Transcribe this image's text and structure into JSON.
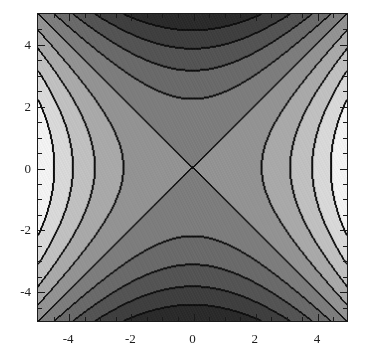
{
  "figure": {
    "background_color": "#ffffff",
    "frame_color": "#1a1a1a",
    "contour_line_color": "#101010"
  },
  "chart_data": {
    "type": "heatmap",
    "plot_style": "filled-contour",
    "title": "",
    "subtitle": "",
    "xlabel": "",
    "ylabel": "",
    "xlim": [
      -5,
      5
    ],
    "ylim": [
      -5,
      5
    ],
    "grid": false,
    "legend": "none",
    "colormap": "grayscale",
    "function_form": "saddle (x^2 - y^2 type): light at left/right edges, dark at top/bottom edges",
    "x_ticks_major": [
      -4,
      -2,
      0,
      2,
      4
    ],
    "x_tick_labels": [
      "-4",
      "-2",
      "0",
      "2",
      "4"
    ],
    "y_ticks_major": [
      -4,
      -2,
      0,
      2,
      4
    ],
    "y_tick_labels": [
      "-4",
      "-2",
      "0",
      "2",
      "4"
    ],
    "x_ticks_minor": [
      -4.5,
      -3.5,
      -3,
      -2.5,
      -1.5,
      -1,
      -0.5,
      0.5,
      1,
      1.5,
      2.5,
      3,
      3.5,
      4.5
    ],
    "y_ticks_minor": [
      -4.5,
      -3.5,
      -3,
      -2.5,
      -1.5,
      -1,
      -0.5,
      0.5,
      1,
      1.5,
      2.5,
      3,
      3.5,
      4.5
    ],
    "frame_ticks_all_sides": true,
    "n_contour_levels": 11,
    "contour_levels": [
      -25,
      -20,
      -15,
      -10,
      -5,
      0,
      5,
      10,
      15,
      20,
      25
    ],
    "band_colors": [
      "#0d0d0d",
      "#2b2b2b",
      "#3f3f3f",
      "#545454",
      "#6a6a6a",
      "#7d7d7d",
      "#939393",
      "#a9a9a9",
      "#c0c0c0",
      "#d8d8d8",
      "#f2f2f2",
      "#ffffff"
    ],
    "grid_resolution": {
      "nx": 311,
      "ny": 309
    }
  },
  "axes": {
    "x_tick_values": [
      -4,
      -2,
      0,
      2,
      4
    ],
    "y_tick_values": [
      -4,
      -2,
      0,
      2,
      4
    ],
    "x_tick_text": [
      "-4",
      "-2",
      "0",
      "2",
      "4"
    ],
    "y_tick_text": [
      "4",
      "2",
      "0",
      "-2",
      "-4"
    ]
  }
}
